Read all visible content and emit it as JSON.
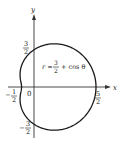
{
  "figure": {
    "equation": {
      "r": "r =",
      "num": "3",
      "den": "2",
      "rest": "+ cos θ"
    },
    "axes": {
      "x_label": "x",
      "y_label": "y",
      "origin_label": "0"
    },
    "ticks": {
      "y_top": {
        "sign": "",
        "num": "3",
        "den": "2"
      },
      "y_bottom": {
        "sign": "−",
        "num": "3",
        "den": "2"
      },
      "x_left": {
        "sign": "−",
        "num": "1",
        "den": "2"
      },
      "x_right": {
        "sign": "",
        "num": "5",
        "den": "2"
      }
    },
    "colors": {
      "curve": "#1a1a1a",
      "axis": "#333333",
      "background": "#ffffff"
    }
  }
}
